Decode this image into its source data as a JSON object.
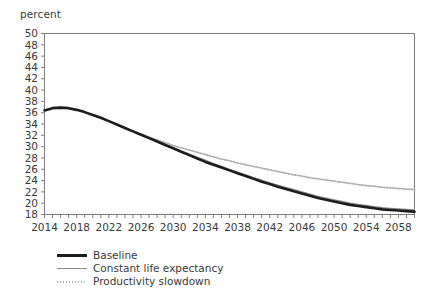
{
  "chart_data": {
    "type": "line",
    "title": "",
    "subtitle": "",
    "unit_label": "percent",
    "xlabel": "",
    "ylabel": "percent",
    "xlim": [
      2014,
      2060
    ],
    "ylim": [
      18,
      50
    ],
    "ytick_step": 2,
    "xtick_step": 4,
    "x_minor_tick_step": 1,
    "grid": false,
    "legend_position": "below-left",
    "yticks": [
      18,
      20,
      22,
      24,
      26,
      28,
      30,
      32,
      34,
      36,
      38,
      40,
      42,
      44,
      46,
      48,
      50
    ],
    "ytick_labels": [
      "18",
      "20",
      "22",
      "24",
      "26",
      "28",
      "30",
      "32",
      "34",
      "36",
      "38",
      "40",
      "42",
      "44",
      "46",
      "48",
      "50"
    ],
    "xticks": [
      2014,
      2018,
      2022,
      2026,
      2030,
      2034,
      2038,
      2042,
      2046,
      2050,
      2054,
      2058
    ],
    "xtick_labels": [
      "2014",
      "2018",
      "2022",
      "2026",
      "2030",
      "2034",
      "2038",
      "2042",
      "2046",
      "2050",
      "2054",
      "2058"
    ],
    "x": [
      2014,
      2015,
      2016,
      2017,
      2018,
      2019,
      2020,
      2021,
      2022,
      2023,
      2024,
      2025,
      2026,
      2027,
      2028,
      2029,
      2030,
      2031,
      2032,
      2033,
      2034,
      2035,
      2036,
      2037,
      2038,
      2039,
      2040,
      2041,
      2042,
      2043,
      2044,
      2045,
      2046,
      2047,
      2048,
      2049,
      2050,
      2051,
      2052,
      2053,
      2054,
      2055,
      2056,
      2057,
      2058,
      2059,
      2060
    ],
    "series": [
      {
        "name": "Baseline",
        "color": "#1c1c1c",
        "style": "solid",
        "width": 2.6,
        "values": [
          36.4,
          36.8,
          36.9,
          36.8,
          36.5,
          36.1,
          35.6,
          35.1,
          34.5,
          33.9,
          33.3,
          32.7,
          32.1,
          31.5,
          30.9,
          30.3,
          29.7,
          29.1,
          28.5,
          27.9,
          27.3,
          26.8,
          26.3,
          25.8,
          25.3,
          24.8,
          24.3,
          23.8,
          23.4,
          22.9,
          22.5,
          22.1,
          21.7,
          21.3,
          20.9,
          20.6,
          20.3,
          20.0,
          19.7,
          19.5,
          19.3,
          19.1,
          18.9,
          18.8,
          18.7,
          18.6,
          18.5
        ]
      },
      {
        "name": "Constant life expectancy",
        "color": "#8a8a8a",
        "style": "solid",
        "width": 1.3,
        "values": [
          36.4,
          36.8,
          36.9,
          36.8,
          36.5,
          36.1,
          35.6,
          35.1,
          34.5,
          33.9,
          33.3,
          32.7,
          32.1,
          31.6,
          31.0,
          30.4,
          29.8,
          29.2,
          28.7,
          28.1,
          27.6,
          27.0,
          26.5,
          26.0,
          25.5,
          25.0,
          24.5,
          24.1,
          23.6,
          23.2,
          22.8,
          22.4,
          22.0,
          21.6,
          21.2,
          20.9,
          20.6,
          20.3,
          20.0,
          19.8,
          19.6,
          19.4,
          19.2,
          19.1,
          19.0,
          18.9,
          18.8
        ]
      },
      {
        "name": "Productivity slowdown",
        "color": "#b0b0b0",
        "style": "dotted",
        "width": 1.8,
        "values": [
          36.4,
          36.8,
          36.9,
          36.8,
          36.5,
          36.1,
          35.6,
          35.1,
          34.5,
          33.9,
          33.3,
          32.7,
          32.2,
          31.7,
          31.2,
          30.7,
          30.2,
          29.8,
          29.4,
          29.0,
          28.6,
          28.2,
          27.8,
          27.5,
          27.1,
          26.8,
          26.5,
          26.2,
          25.9,
          25.6,
          25.3,
          25.0,
          24.8,
          24.5,
          24.3,
          24.1,
          23.9,
          23.7,
          23.5,
          23.3,
          23.1,
          23.0,
          22.8,
          22.7,
          22.6,
          22.5,
          22.4
        ]
      }
    ]
  },
  "legend": {
    "items": [
      {
        "label": "Baseline",
        "swatch": "line-solid-thick-black"
      },
      {
        "label": "Constant life expectancy",
        "swatch": "line-solid-thin-gray"
      },
      {
        "label": "Productivity slowdown",
        "swatch": "line-dotted-gray"
      }
    ]
  }
}
